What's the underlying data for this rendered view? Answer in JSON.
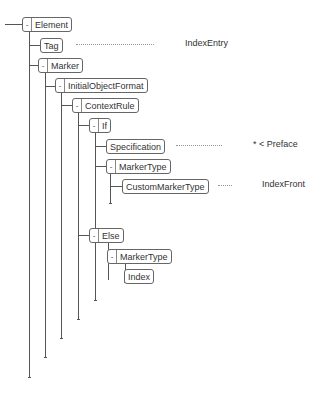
{
  "tree": {
    "nodes": [
      {
        "id": "element",
        "label": "Element",
        "toggle": "-",
        "value": ""
      },
      {
        "id": "tag",
        "label": "Tag",
        "toggle": "",
        "value": "IndexEntry"
      },
      {
        "id": "marker",
        "label": "Marker",
        "toggle": "-",
        "value": ""
      },
      {
        "id": "initial-object-format",
        "label": "InitialObjectFormat",
        "toggle": "-",
        "value": ""
      },
      {
        "id": "context-rule",
        "label": "ContextRule",
        "toggle": "-",
        "value": ""
      },
      {
        "id": "if",
        "label": "If",
        "toggle": "-",
        "value": ""
      },
      {
        "id": "specification",
        "label": "Specification",
        "toggle": "",
        "value": "* < Preface"
      },
      {
        "id": "marker-type-1",
        "label": "MarkerType",
        "toggle": "-",
        "value": ""
      },
      {
        "id": "custom-marker-type",
        "label": "CustomMarkerType",
        "toggle": "",
        "value": "IndexFront"
      },
      {
        "id": "else",
        "label": "Else",
        "toggle": "-",
        "value": ""
      },
      {
        "id": "marker-type-2",
        "label": "MarkerType",
        "toggle": "-",
        "value": ""
      },
      {
        "id": "index",
        "label": "Index",
        "toggle": "",
        "value": ""
      }
    ]
  }
}
